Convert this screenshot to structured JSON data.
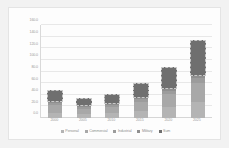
{
  "chart_data": {
    "type": "bar",
    "title": "",
    "subtitle": "",
    "xlabel": "",
    "ylabel": "",
    "stacked": true,
    "grid": true,
    "legend_position": "bottom",
    "ylim": [
      0,
      160
    ],
    "ytick_step": 20,
    "ytick_labels": [
      "0.0",
      "20.0",
      "40.0",
      "60.0",
      "80.0",
      "100.0",
      "120.0",
      "140.0",
      "160.0"
    ],
    "ytick_values": [
      0,
      20,
      40,
      60,
      80,
      100,
      120,
      140,
      160
    ],
    "categories": [
      "2000",
      "2005",
      "2010",
      "2015",
      "2020",
      "2025"
    ],
    "series": [
      {
        "name": "Personal",
        "color": "#b4b4b4",
        "values": [
          9,
          7,
          8,
          12,
          19,
          28
        ]
      },
      {
        "name": "Commercial",
        "color": "#a8a8a8",
        "values": [
          13,
          9,
          11,
          16,
          23,
          33
        ]
      },
      {
        "name": "Industrial",
        "color": "#9c9c9c",
        "values": [
          4,
          3,
          3,
          4,
          5,
          7
        ]
      },
      {
        "name": "Military",
        "color": "#8f8f8f",
        "values": [
          2,
          1,
          2,
          2,
          3,
          4
        ]
      },
      {
        "name": "Sum",
        "color": "#6f6f6f",
        "values": [
          48,
          35,
          42,
          60,
          87,
          135
        ]
      }
    ],
    "sum_bar_outline": "dashed"
  },
  "legend": {
    "items": [
      {
        "label": "Personal",
        "color": "#b4b4b4"
      },
      {
        "label": "Commercial",
        "color": "#a8a8a8"
      },
      {
        "label": "Industrial",
        "color": "#9c9c9c"
      },
      {
        "label": "Military",
        "color": "#8f8f8f"
      },
      {
        "label": "Sum",
        "color": "#6f6f6f"
      }
    ]
  },
  "colors": {
    "page_background": "#f2f2f2",
    "plot_background": "#fdfdfd",
    "gridline": "#e8e8e8",
    "axis_text": "#9a9a9a",
    "legend_text": "#8f8f8f"
  }
}
